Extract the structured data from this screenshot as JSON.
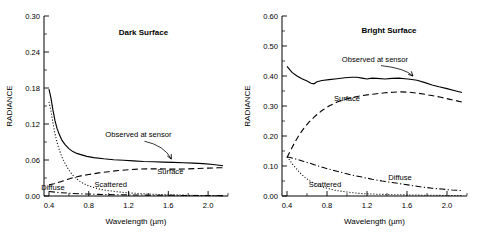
{
  "figure": {
    "xlabel": "Wavelength (µm)",
    "ylabel": "RADIANCE"
  },
  "chart_data": [
    {
      "type": "line",
      "title": "Dark Surface",
      "xlabel": "Wavelength (µm)",
      "ylabel": "RADIANCE",
      "xlim": [
        0.35,
        2.2
      ],
      "ylim": [
        0.0,
        0.3
      ],
      "xticks": [
        0.4,
        0.8,
        1.2,
        1.6,
        2.0
      ],
      "xticklabels": [
        "0.4",
        "0.8",
        "1.2",
        "1.6",
        "2.0"
      ],
      "yticks": [
        0.0,
        0.06,
        0.12,
        0.18,
        0.24,
        0.3
      ],
      "yticklabels": [
        "0.00",
        "0.06",
        "0.12",
        "0.18",
        "0.24",
        "0.30"
      ],
      "grid": false,
      "legend": "inline-annotations",
      "annotations": [
        {
          "text": "Dark Surface",
          "x": 1.35,
          "y": 0.268,
          "style": "bold"
        },
        {
          "text": "Observed at sensor",
          "x": 1.3,
          "y": 0.098,
          "style": "plain",
          "leader_to": [
            1.63,
            0.059
          ]
        },
        {
          "text": "Surface",
          "x": 1.62,
          "y": 0.036,
          "style": "plain"
        },
        {
          "text": "Scattered",
          "x": 1.02,
          "y": 0.0145,
          "style": "plain"
        },
        {
          "text": "Diffuse",
          "x": 0.44,
          "y": 0.0105,
          "style": "plain"
        }
      ],
      "series": [
        {
          "name": "Observed at sensor",
          "style": "solid",
          "x": [
            0.4,
            0.42,
            0.44,
            0.46,
            0.48,
            0.5,
            0.53,
            0.56,
            0.6,
            0.64,
            0.68,
            0.72,
            0.78,
            0.85,
            0.95,
            1.05,
            1.15,
            1.25,
            1.35,
            1.45,
            1.55,
            1.65,
            1.75,
            1.85,
            1.95,
            2.05,
            2.15
          ],
          "y": [
            0.178,
            0.163,
            0.143,
            0.126,
            0.113,
            0.104,
            0.093,
            0.086,
            0.079,
            0.074,
            0.071,
            0.069,
            0.066,
            0.064,
            0.062,
            0.0605,
            0.0595,
            0.0585,
            0.0575,
            0.057,
            0.0565,
            0.056,
            0.0555,
            0.0548,
            0.054,
            0.0525,
            0.0505
          ]
        },
        {
          "name": "Surface",
          "style": "dashed",
          "x": [
            0.4,
            0.45,
            0.5,
            0.55,
            0.6,
            0.65,
            0.72,
            0.8,
            0.9,
            1.0,
            1.1,
            1.2,
            1.3,
            1.4,
            1.5,
            1.6,
            1.7,
            1.8,
            1.9,
            2.0,
            2.1,
            2.15
          ],
          "y": [
            0.0185,
            0.0205,
            0.023,
            0.0255,
            0.0285,
            0.031,
            0.0335,
            0.0358,
            0.0385,
            0.0405,
            0.0425,
            0.0438,
            0.0448,
            0.0452,
            0.0452,
            0.0448,
            0.0448,
            0.0452,
            0.0458,
            0.0465,
            0.047,
            0.047
          ]
        },
        {
          "name": "Scattered",
          "style": "dotted",
          "x": [
            0.4,
            0.42,
            0.44,
            0.46,
            0.48,
            0.5,
            0.53,
            0.56,
            0.6,
            0.65,
            0.7,
            0.75,
            0.8,
            0.9,
            1.0,
            1.1,
            1.2,
            1.35,
            1.5,
            1.7,
            1.9,
            2.1,
            2.15
          ],
          "y": [
            0.157,
            0.142,
            0.122,
            0.104,
            0.09,
            0.079,
            0.065,
            0.055,
            0.043,
            0.0325,
            0.0255,
            0.0205,
            0.0168,
            0.0118,
            0.0088,
            0.0068,
            0.0052,
            0.0036,
            0.0026,
            0.0016,
            0.001,
            0.0006,
            0.0005
          ]
        },
        {
          "name": "Diffuse",
          "style": "dashdot",
          "x": [
            0.4,
            0.5,
            0.6,
            0.7,
            0.8,
            0.9,
            1.0,
            1.1,
            1.2,
            1.35,
            1.5,
            1.65,
            1.8,
            1.95,
            2.1,
            2.15
          ],
          "y": [
            0.0075,
            0.0058,
            0.0046,
            0.0038,
            0.0032,
            0.0027,
            0.0023,
            0.002,
            0.0018,
            0.0015,
            0.0013,
            0.0011,
            0.0009,
            0.0008,
            0.0007,
            0.0006
          ]
        }
      ]
    },
    {
      "type": "line",
      "title": "Bright Surface",
      "xlabel": "Wavelength (µm)",
      "ylabel": "RADIANCE",
      "xlim": [
        0.35,
        2.2
      ],
      "ylim": [
        0.0,
        0.6
      ],
      "xticks": [
        0.4,
        0.8,
        1.2,
        1.6,
        2.0
      ],
      "xticklabels": [
        "0.4",
        "0.8",
        "1.2",
        "1.6",
        "2.0"
      ],
      "yticks": [
        0.0,
        0.1,
        0.2,
        0.3,
        0.4,
        0.5,
        0.6
      ],
      "yticklabels": [
        "0.00",
        "0.10",
        "0.20",
        "0.30",
        "0.40",
        "0.50",
        "0.60"
      ],
      "grid": false,
      "legend": "inline-annotations",
      "annotations": [
        {
          "text": "Bright Surface",
          "x": 1.42,
          "y": 0.545,
          "style": "bold"
        },
        {
          "text": "Observed at sensor",
          "x": 1.28,
          "y": 0.448,
          "style": "plain",
          "leader_to": [
            1.66,
            0.395
          ]
        },
        {
          "text": "Surface",
          "x": 1.0,
          "y": 0.316,
          "style": "plain"
        },
        {
          "text": "Diffuse",
          "x": 1.53,
          "y": 0.055,
          "style": "plain"
        },
        {
          "text": "Scattered",
          "x": 0.78,
          "y": 0.03,
          "style": "plain"
        }
      ],
      "series": [
        {
          "name": "Observed at sensor",
          "style": "solid",
          "x": [
            0.4,
            0.45,
            0.5,
            0.55,
            0.6,
            0.64,
            0.67,
            0.7,
            0.75,
            0.82,
            0.9,
            0.98,
            1.05,
            1.1,
            1.15,
            1.2,
            1.25,
            1.3,
            1.38,
            1.45,
            1.52,
            1.58,
            1.63,
            1.7,
            1.78,
            1.85,
            1.92,
            2.0,
            2.08,
            2.15
          ],
          "y": [
            0.432,
            0.412,
            0.4,
            0.391,
            0.383,
            0.376,
            0.374,
            0.381,
            0.385,
            0.388,
            0.391,
            0.394,
            0.396,
            0.396,
            0.393,
            0.39,
            0.393,
            0.392,
            0.39,
            0.392,
            0.393,
            0.391,
            0.389,
            0.386,
            0.378,
            0.37,
            0.364,
            0.358,
            0.351,
            0.345
          ]
        },
        {
          "name": "Surface",
          "style": "dashed",
          "x": [
            0.4,
            0.44,
            0.48,
            0.52,
            0.57,
            0.62,
            0.68,
            0.75,
            0.82,
            0.9,
            0.98,
            1.06,
            1.14,
            1.22,
            1.3,
            1.38,
            1.46,
            1.54,
            1.62,
            1.7,
            1.78,
            1.86,
            1.94,
            2.02,
            2.1,
            2.15
          ],
          "y": [
            0.128,
            0.155,
            0.18,
            0.203,
            0.226,
            0.246,
            0.266,
            0.285,
            0.3,
            0.313,
            0.322,
            0.329,
            0.334,
            0.338,
            0.341,
            0.344,
            0.346,
            0.347,
            0.346,
            0.343,
            0.339,
            0.334,
            0.329,
            0.323,
            0.317,
            0.313
          ]
        },
        {
          "name": "Diffuse",
          "style": "dashdot",
          "x": [
            0.4,
            0.45,
            0.5,
            0.56,
            0.62,
            0.7,
            0.78,
            0.86,
            0.95,
            1.05,
            1.15,
            1.25,
            1.35,
            1.45,
            1.55,
            1.65,
            1.75,
            1.85,
            1.95,
            2.05,
            2.15
          ],
          "y": [
            0.131,
            0.127,
            0.122,
            0.116,
            0.11,
            0.101,
            0.093,
            0.086,
            0.078,
            0.07,
            0.063,
            0.056,
            0.05,
            0.045,
            0.04,
            0.035,
            0.03,
            0.026,
            0.023,
            0.02,
            0.018
          ]
        },
        {
          "name": "Scattered",
          "style": "dotted",
          "x": [
            0.4,
            0.43,
            0.46,
            0.5,
            0.54,
            0.58,
            0.63,
            0.68,
            0.74,
            0.8,
            0.88,
            0.96,
            1.05,
            1.15,
            1.3,
            1.45,
            1.6,
            1.8,
            2.0,
            2.15
          ],
          "y": [
            0.131,
            0.118,
            0.104,
            0.088,
            0.074,
            0.062,
            0.05,
            0.041,
            0.032,
            0.026,
            0.019,
            0.015,
            0.011,
            0.008,
            0.006,
            0.0045,
            0.0035,
            0.0025,
            0.0018,
            0.0014
          ]
        }
      ]
    }
  ]
}
